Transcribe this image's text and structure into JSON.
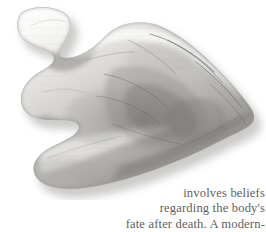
{
  "page": {
    "width": 266,
    "height": 232,
    "background_color": "#ffffff"
  },
  "figure": {
    "name": "stone-projectile-point-photograph",
    "colors": {
      "stone_light": "#f2f1ef",
      "stone_mid": "#c9c7c4",
      "stone_dark": "#8e8c89",
      "stone_shadow": "#5d5b58",
      "flake_scar_line": "#4a4845",
      "drop_shadow": "#b9b7b4",
      "background": "#ffffff"
    }
  },
  "bodytext": {
    "alignment": "right",
    "color": "#5f5f62",
    "lines": [
      "involves beliefs",
      "regarding the body's",
      "fate after death. A modern-"
    ]
  }
}
